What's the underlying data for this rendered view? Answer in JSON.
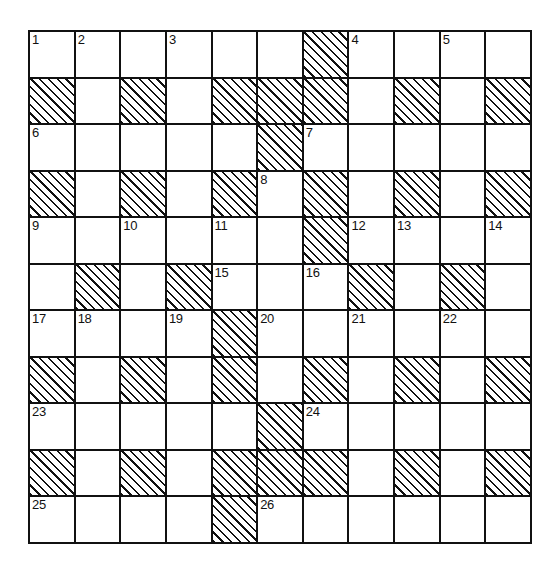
{
  "puzzle": {
    "title": "",
    "type": "crossword-grid",
    "rows": 11,
    "cols": 11,
    "colors": {
      "grid_line": "#111111",
      "cell_background": "#ffffff",
      "blocked_hatch": "#111111",
      "number_text": "#111111"
    },
    "legend": {
      "blocked_label": "hatched square",
      "open_label": "open square"
    },
    "clue_numbers_present": [
      "1",
      "2",
      "3",
      "4",
      "5",
      "6",
      "7",
      "8",
      "9",
      "10",
      "11",
      "12",
      "13",
      "14",
      "15",
      "16",
      "17",
      "18",
      "19",
      "20",
      "21",
      "22",
      "23",
      "24",
      "25",
      "26"
    ],
    "grid": [
      [
        {
          "blocked": false,
          "num": "1"
        },
        {
          "blocked": false,
          "num": "2"
        },
        {
          "blocked": false,
          "num": ""
        },
        {
          "blocked": false,
          "num": "3"
        },
        {
          "blocked": false,
          "num": ""
        },
        {
          "blocked": false,
          "num": ""
        },
        {
          "blocked": true,
          "num": ""
        },
        {
          "blocked": false,
          "num": "4"
        },
        {
          "blocked": false,
          "num": ""
        },
        {
          "blocked": false,
          "num": "5"
        },
        {
          "blocked": false,
          "num": ""
        }
      ],
      [
        {
          "blocked": true,
          "num": ""
        },
        {
          "blocked": false,
          "num": ""
        },
        {
          "blocked": true,
          "num": ""
        },
        {
          "blocked": false,
          "num": ""
        },
        {
          "blocked": true,
          "num": ""
        },
        {
          "blocked": true,
          "num": ""
        },
        {
          "blocked": true,
          "num": ""
        },
        {
          "blocked": false,
          "num": ""
        },
        {
          "blocked": true,
          "num": ""
        },
        {
          "blocked": false,
          "num": ""
        },
        {
          "blocked": true,
          "num": ""
        }
      ],
      [
        {
          "blocked": false,
          "num": "6"
        },
        {
          "blocked": false,
          "num": ""
        },
        {
          "blocked": false,
          "num": ""
        },
        {
          "blocked": false,
          "num": ""
        },
        {
          "blocked": false,
          "num": ""
        },
        {
          "blocked": true,
          "num": ""
        },
        {
          "blocked": false,
          "num": "7"
        },
        {
          "blocked": false,
          "num": ""
        },
        {
          "blocked": false,
          "num": ""
        },
        {
          "blocked": false,
          "num": ""
        },
        {
          "blocked": false,
          "num": ""
        }
      ],
      [
        {
          "blocked": true,
          "num": ""
        },
        {
          "blocked": false,
          "num": ""
        },
        {
          "blocked": true,
          "num": ""
        },
        {
          "blocked": false,
          "num": ""
        },
        {
          "blocked": true,
          "num": ""
        },
        {
          "blocked": false,
          "num": "8"
        },
        {
          "blocked": true,
          "num": ""
        },
        {
          "blocked": false,
          "num": ""
        },
        {
          "blocked": true,
          "num": ""
        },
        {
          "blocked": false,
          "num": ""
        },
        {
          "blocked": true,
          "num": ""
        }
      ],
      [
        {
          "blocked": false,
          "num": "9"
        },
        {
          "blocked": false,
          "num": ""
        },
        {
          "blocked": false,
          "num": "10"
        },
        {
          "blocked": false,
          "num": ""
        },
        {
          "blocked": false,
          "num": "11"
        },
        {
          "blocked": false,
          "num": ""
        },
        {
          "blocked": true,
          "num": ""
        },
        {
          "blocked": false,
          "num": "12"
        },
        {
          "blocked": false,
          "num": "13"
        },
        {
          "blocked": false,
          "num": ""
        },
        {
          "blocked": false,
          "num": "14"
        }
      ],
      [
        {
          "blocked": false,
          "num": ""
        },
        {
          "blocked": true,
          "num": ""
        },
        {
          "blocked": false,
          "num": ""
        },
        {
          "blocked": true,
          "num": ""
        },
        {
          "blocked": false,
          "num": "15"
        },
        {
          "blocked": false,
          "num": ""
        },
        {
          "blocked": false,
          "num": "16"
        },
        {
          "blocked": true,
          "num": ""
        },
        {
          "blocked": false,
          "num": ""
        },
        {
          "blocked": true,
          "num": ""
        },
        {
          "blocked": false,
          "num": ""
        }
      ],
      [
        {
          "blocked": false,
          "num": "17"
        },
        {
          "blocked": false,
          "num": "18"
        },
        {
          "blocked": false,
          "num": ""
        },
        {
          "blocked": false,
          "num": "19"
        },
        {
          "blocked": true,
          "num": ""
        },
        {
          "blocked": false,
          "num": "20"
        },
        {
          "blocked": false,
          "num": ""
        },
        {
          "blocked": false,
          "num": "21"
        },
        {
          "blocked": false,
          "num": ""
        },
        {
          "blocked": false,
          "num": "22"
        },
        {
          "blocked": false,
          "num": ""
        }
      ],
      [
        {
          "blocked": true,
          "num": ""
        },
        {
          "blocked": false,
          "num": ""
        },
        {
          "blocked": true,
          "num": ""
        },
        {
          "blocked": false,
          "num": ""
        },
        {
          "blocked": true,
          "num": ""
        },
        {
          "blocked": false,
          "num": ""
        },
        {
          "blocked": true,
          "num": ""
        },
        {
          "blocked": false,
          "num": ""
        },
        {
          "blocked": true,
          "num": ""
        },
        {
          "blocked": false,
          "num": ""
        },
        {
          "blocked": true,
          "num": ""
        }
      ],
      [
        {
          "blocked": false,
          "num": "23"
        },
        {
          "blocked": false,
          "num": ""
        },
        {
          "blocked": false,
          "num": ""
        },
        {
          "blocked": false,
          "num": ""
        },
        {
          "blocked": false,
          "num": ""
        },
        {
          "blocked": true,
          "num": ""
        },
        {
          "blocked": false,
          "num": "24"
        },
        {
          "blocked": false,
          "num": ""
        },
        {
          "blocked": false,
          "num": ""
        },
        {
          "blocked": false,
          "num": ""
        },
        {
          "blocked": false,
          "num": ""
        }
      ],
      [
        {
          "blocked": true,
          "num": ""
        },
        {
          "blocked": false,
          "num": ""
        },
        {
          "blocked": true,
          "num": ""
        },
        {
          "blocked": false,
          "num": ""
        },
        {
          "blocked": true,
          "num": ""
        },
        {
          "blocked": true,
          "num": ""
        },
        {
          "blocked": true,
          "num": ""
        },
        {
          "blocked": false,
          "num": ""
        },
        {
          "blocked": true,
          "num": ""
        },
        {
          "blocked": false,
          "num": ""
        },
        {
          "blocked": true,
          "num": ""
        }
      ],
      [
        {
          "blocked": false,
          "num": "25"
        },
        {
          "blocked": false,
          "num": ""
        },
        {
          "blocked": false,
          "num": ""
        },
        {
          "blocked": false,
          "num": ""
        },
        {
          "blocked": true,
          "num": ""
        },
        {
          "blocked": false,
          "num": "26"
        },
        {
          "blocked": false,
          "num": ""
        },
        {
          "blocked": false,
          "num": ""
        },
        {
          "blocked": false,
          "num": ""
        },
        {
          "blocked": false,
          "num": ""
        },
        {
          "blocked": false,
          "num": ""
        }
      ]
    ]
  }
}
